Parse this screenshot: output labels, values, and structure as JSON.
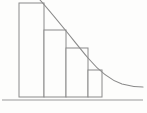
{
  "figure": {
    "background_color": "#fdfdfc",
    "line_color": "#8a8a8a",
    "axis_color": "#9a9a9a",
    "bar_fill_color": "#fdfdfc",
    "title": "",
    "caption": ""
  },
  "chart_data": {
    "type": "bar",
    "title": "",
    "subtitle": "",
    "xlabel": "",
    "ylabel": "",
    "categories": [
      "1",
      "2",
      "3",
      "4"
    ],
    "values": [
      94,
      67,
      49,
      27
    ],
    "ylim": [
      0,
      100
    ],
    "xlim": [
      0,
      147
    ],
    "grid": false,
    "legend": null,
    "tick_labels": {
      "x": [],
      "y": []
    },
    "annotations": [],
    "bars_px": [
      {
        "x0": 19,
        "x1": 44,
        "top": 3,
        "bottom": 97
      },
      {
        "x0": 44,
        "x1": 66,
        "top": 30,
        "bottom": 97
      },
      {
        "x0": 66,
        "x1": 88,
        "top": 48,
        "bottom": 97
      },
      {
        "x0": 88,
        "x1": 102,
        "top": 70,
        "bottom": 97
      }
    ],
    "series": [
      {
        "name": "bars",
        "type": "bar",
        "values": [
          94,
          67,
          49,
          27
        ]
      },
      {
        "name": "trend-curve",
        "type": "line",
        "description": "smooth decreasing curve overlaying the bars, flattening toward the right",
        "points": [
          [
            40,
            0
          ],
          [
            56,
            18
          ],
          [
            72,
            38
          ],
          [
            88,
            58
          ],
          [
            98,
            69
          ],
          [
            108,
            78
          ],
          [
            118,
            83
          ],
          [
            130,
            86
          ],
          [
            143,
            87
          ]
        ]
      }
    ],
    "baseline_px": {
      "x0": 2,
      "x1": 143,
      "y": 100
    }
  },
  "paths": {
    "curve_d": "M 40 0 C 55 17 70 36 88 58 C 99 71 110 80 122 84 C 131 86.5 137 87 143 87",
    "baseline_d": "M 2 100 L 143 100"
  }
}
